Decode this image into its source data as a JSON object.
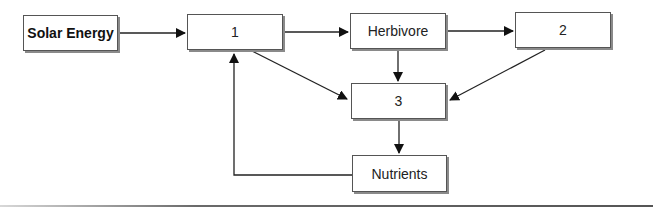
{
  "diagram": {
    "type": "flowchart",
    "title": "",
    "nodes": [
      {
        "id": "solar",
        "label": "Solar Energy"
      },
      {
        "id": "n1",
        "label": "1"
      },
      {
        "id": "herbivore",
        "label": "Herbivore"
      },
      {
        "id": "n2",
        "label": "2"
      },
      {
        "id": "n3",
        "label": "3"
      },
      {
        "id": "nutrients",
        "label": "Nutrients"
      }
    ],
    "edges": [
      {
        "from": "Solar Energy",
        "to": "1"
      },
      {
        "from": "1",
        "to": "Herbivore"
      },
      {
        "from": "Herbivore",
        "to": "2"
      },
      {
        "from": "1",
        "to": "3"
      },
      {
        "from": "Herbivore",
        "to": "3"
      },
      {
        "from": "2",
        "to": "3"
      },
      {
        "from": "3",
        "to": "Nutrients"
      },
      {
        "from": "Nutrients",
        "to": "1"
      }
    ]
  },
  "colors": {
    "line": "#222222",
    "box_border": "#555555",
    "shadow": "#8a8a8a"
  }
}
